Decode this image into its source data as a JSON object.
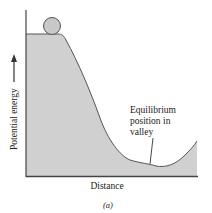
{
  "diagram": {
    "type": "potential-energy-landscape",
    "y_axis_label": "Potential energy",
    "x_axis_label": "Distance",
    "annotation": {
      "lines": [
        "Equilibrium",
        "position in",
        "valley"
      ]
    },
    "caption": "(a)",
    "ball": {
      "description": "ball resting on plateau at top"
    },
    "colors": {
      "fill": "#d0d0d0",
      "stroke": "#555555",
      "ball_fill": "#c8c8c8",
      "text": "#222222"
    }
  }
}
